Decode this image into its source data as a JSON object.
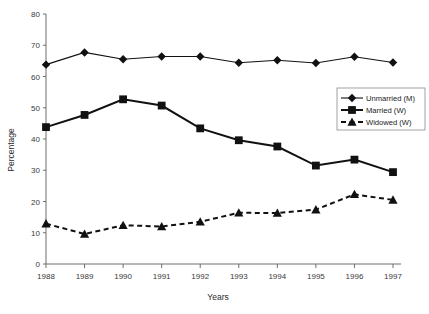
{
  "chart_data": {
    "type": "line",
    "title": "",
    "xlabel": "Years",
    "ylabel": "Percentage",
    "categories": [
      "1988",
      "1989",
      "1990",
      "1991",
      "1992",
      "1993",
      "1994",
      "1995",
      "1996",
      "1997"
    ],
    "x": [
      1988,
      1989,
      1990,
      1991,
      1992,
      1993,
      1994,
      1995,
      1996,
      1997
    ],
    "xlim": [
      1988,
      1997
    ],
    "ylim": [
      0,
      80
    ],
    "yticks": [
      0,
      10,
      20,
      30,
      40,
      50,
      60,
      70,
      80
    ],
    "grid": false,
    "legend_position": "right",
    "series": [
      {
        "name": "Unmarried (M)",
        "marker": "diamond",
        "linestyle": "solid",
        "color": "#111111",
        "values": [
          63.8,
          67.7,
          65.5,
          66.4,
          66.4,
          64.4,
          65.2,
          64.3,
          66.3,
          64.5
        ]
      },
      {
        "name": "Married (W)",
        "marker": "square",
        "linestyle": "solid",
        "color": "#111111",
        "values": [
          43.8,
          47.7,
          52.7,
          50.7,
          43.4,
          39.6,
          37.6,
          31.5,
          33.4,
          29.4
        ]
      },
      {
        "name": "Widowed (W)",
        "marker": "triangle",
        "linestyle": "dashed",
        "color": "#111111",
        "values": [
          12.9,
          9.6,
          12.4,
          12.0,
          13.5,
          16.4,
          16.3,
          17.4,
          22.3,
          20.5
        ]
      }
    ]
  },
  "axis": {
    "y_title": "Percentage",
    "x_title": "Years",
    "y_tick_labels": [
      "0",
      "10",
      "20",
      "30",
      "40",
      "50",
      "60",
      "70",
      "80"
    ],
    "x_tick_labels": [
      "1988",
      "1989",
      "1990",
      "1991",
      "1992",
      "1993",
      "1994",
      "1995",
      "1996",
      "1997"
    ]
  },
  "legend": {
    "items": [
      {
        "label": "Unmarried (M)"
      },
      {
        "label": "Married (W)"
      },
      {
        "label": "Widowed (W)"
      }
    ]
  }
}
